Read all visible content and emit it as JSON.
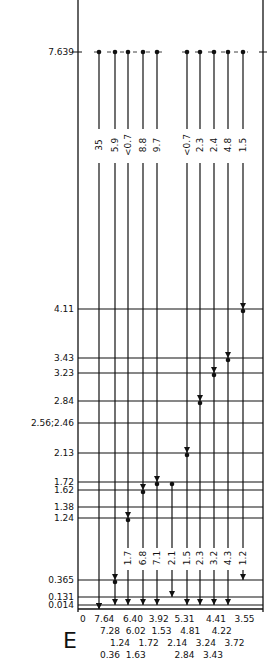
{
  "diagram": {
    "panel_letter": "E",
    "top_level": "7.639",
    "levels": [
      {
        "value": 7.639,
        "label": "7.639"
      },
      {
        "value": 4.11,
        "label": "4.11"
      },
      {
        "value": 3.43,
        "label": "3.43"
      },
      {
        "value": 3.23,
        "label": "3.23"
      },
      {
        "value": 2.84,
        "label": "2.84"
      },
      {
        "value": 2.51,
        "label": "2.56;2.46"
      },
      {
        "value": 2.13,
        "label": "2.13"
      },
      {
        "value": 1.72,
        "label": "1.72"
      },
      {
        "value": 1.62,
        "label": "1.62"
      },
      {
        "value": 1.38,
        "label": "1.38"
      },
      {
        "value": 1.24,
        "label": "1.24"
      },
      {
        "value": 0.365,
        "label": "0.365"
      },
      {
        "value": 0.131,
        "label": "0.131"
      },
      {
        "value": 0.014,
        "label": "0.014"
      }
    ],
    "primary_transitions": [
      {
        "from": 7.639,
        "to": 0,
        "intensity": "35"
      },
      {
        "from": 7.639,
        "to": 0.365,
        "intensity": "5.9"
      },
      {
        "from": 7.639,
        "to": 1.24,
        "intensity": "<0.7"
      },
      {
        "from": 7.639,
        "to": 1.62,
        "intensity": "8.8"
      },
      {
        "from": 7.639,
        "to": 1.72,
        "intensity": "9.7"
      },
      {
        "from": 7.639,
        "to": 2.13,
        "intensity": "<0.7"
      },
      {
        "from": 7.639,
        "to": 2.84,
        "intensity": "2.3"
      },
      {
        "from": 7.639,
        "to": 3.23,
        "intensity": "2.4"
      },
      {
        "from": 7.639,
        "to": 3.43,
        "intensity": "4.8"
      },
      {
        "from": 7.639,
        "to": 4.11,
        "intensity": "1.5"
      }
    ],
    "secondary_transitions": [
      {
        "column": 1,
        "from": 0.365,
        "to": 0.014,
        "intensity": ""
      },
      {
        "column": 2,
        "from": 1.24,
        "to": 0.014,
        "intensity": "1.7"
      },
      {
        "column": 3,
        "from": 1.62,
        "to": 0.014,
        "intensity": "6.8"
      },
      {
        "column": 4,
        "from": 1.72,
        "to": 0.014,
        "intensity": "7.1"
      },
      {
        "column": 4.5,
        "from": 1.72,
        "to": 0.131,
        "intensity": "2.1"
      },
      {
        "column": 5,
        "from": 2.13,
        "to": 0.014,
        "intensity": "1.5"
      },
      {
        "column": 6,
        "from": 2.84,
        "to": 0.014,
        "intensity": "2.3"
      },
      {
        "column": 7,
        "from": 3.23,
        "to": 0.014,
        "intensity": "3.2"
      },
      {
        "column": 8,
        "from": 3.43,
        "to": 0.014,
        "intensity": "4.3"
      },
      {
        "column": 9,
        "from": 4.11,
        "to": 0.365,
        "intensity": "1.2"
      }
    ],
    "energy_rows": [
      "0   7.64   6.40  3.92  5.31    4.41   3.55",
      "7.28  6.02  1.53   4.81    4.22",
      "1.24   1.72   2.14   3.24   3.72",
      "0.36  1.63          2.84   3.43"
    ]
  }
}
